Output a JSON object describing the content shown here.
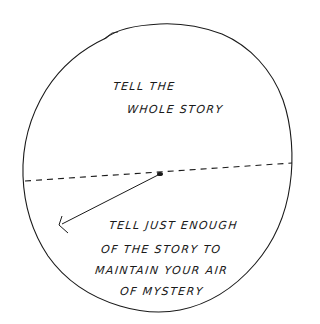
{
  "diagram": {
    "upper_region": {
      "lines": [
        "TELL THE",
        "WHOLE STORY"
      ]
    },
    "lower_region": {
      "lines": [
        "TELL JUST ENOUGH",
        "OF THE STORY TO",
        "MAINTAIN YOUR AIR",
        "OF MYSTERY"
      ]
    },
    "colors": {
      "ink": "#1a1a1a",
      "background": "#ffffff"
    }
  }
}
